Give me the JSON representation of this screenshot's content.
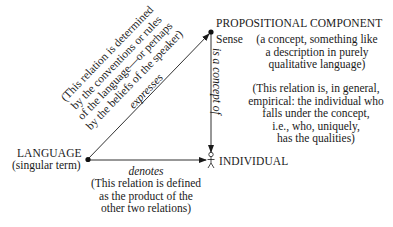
{
  "nodes": {
    "proposition": {
      "title": "PROPOSITIONAL COMPONENT",
      "sense_label": "Sense",
      "sense_description": [
        "(a concept, something like",
        "a description in purely",
        "qualitative language)"
      ]
    },
    "language": {
      "title": "LANGUAGE",
      "subtitle": "(singular term)"
    },
    "individual": {
      "title": "INDIVIDUAL"
    }
  },
  "relations": {
    "expresses": {
      "label": "expresses",
      "note": [
        "(This relation is determined",
        "by the conventions or rules",
        "of the language—or perhaps",
        "by the beliefs of the speaker)"
      ]
    },
    "concept_of": {
      "label": "is a concept of",
      "note": [
        "(This relation is, in general,",
        "empirical: the individual who",
        "falls under the concept,",
        "i.e., who, uniquely,",
        "has the qualities)"
      ]
    },
    "denotes": {
      "label": "denotes",
      "note": [
        "(This relation is defined",
        "as the product of the",
        "other two relations)"
      ]
    }
  }
}
